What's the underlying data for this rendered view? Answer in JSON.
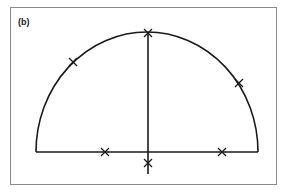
{
  "figure": {
    "panel_label": "(b)",
    "colors": {
      "stroke": "#1a1a1a",
      "frame": "#8a8a8a",
      "background": "#ffffff"
    },
    "shape": "semicircle-with-vertical-diameter",
    "baseline": {
      "x1": 36,
      "x2": 258,
      "y": 152
    },
    "arc": {
      "cx": 147,
      "cy": 152,
      "rx": 111,
      "ry": 120
    },
    "vertical_axis": {
      "x": 148,
      "y1": 32,
      "y2": 174
    },
    "markers": [
      {
        "name": "arc-top",
        "x": 148,
        "y": 33
      },
      {
        "name": "arc-left",
        "x": 73,
        "y": 62
      },
      {
        "name": "arc-right",
        "x": 239,
        "y": 83
      },
      {
        "name": "base-left",
        "x": 105,
        "y": 152
      },
      {
        "name": "base-right",
        "x": 222,
        "y": 152
      },
      {
        "name": "below-base",
        "x": 148,
        "y": 163
      }
    ]
  }
}
